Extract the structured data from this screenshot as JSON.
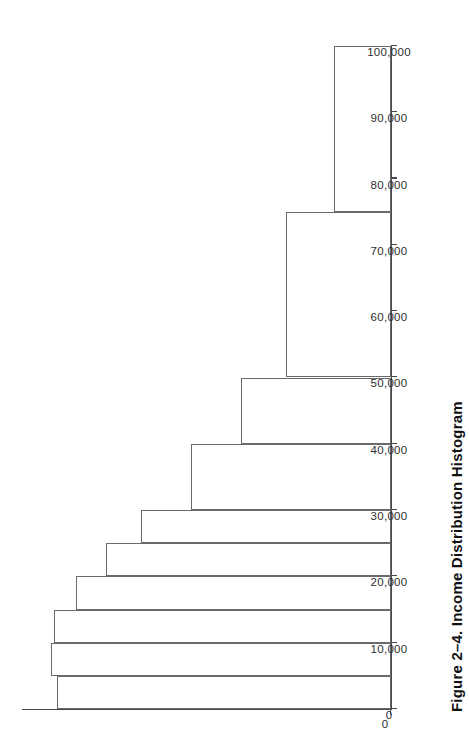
{
  "figure": {
    "caption": "Figure 2–4. Income Distribution Histogram",
    "caption_number": "Figure 2–4.",
    "caption_title": "Income Distribution Histogram"
  },
  "style": {
    "line_color": "#6a6a6a",
    "axis_color": "#4a4a4a",
    "background": "#ffffff",
    "text_color": "#2e2e2e",
    "bar_fill": "none"
  },
  "chart_data": {
    "type": "bar",
    "title": "Income Distribution Histogram",
    "xlabel": "",
    "ylabel": "",
    "grid": false,
    "legend": null,
    "orientation": "vertical-rotated-90ccw",
    "xlim": [
      0,
      100000
    ],
    "ylim": [
      0,
      400
    ],
    "x_tick_labels": [
      "0",
      "10,000",
      "20,000",
      "30,000",
      "40,000",
      "50,000",
      "60,000",
      "70,000",
      "80,000",
      "90,000",
      "100,000"
    ],
    "x_tick_values": [
      0,
      10000,
      20000,
      30000,
      40000,
      50000,
      60000,
      70000,
      80000,
      90000,
      100000
    ],
    "y_tick_labels": [
      "0"
    ],
    "y_tick_values": [
      0
    ],
    "bin_edges": [
      0,
      5000,
      10000,
      15000,
      20000,
      25000,
      30000,
      40000,
      50000,
      75000,
      100000
    ],
    "bins": [
      {
        "label": "0–5,000",
        "lower": 0,
        "upper": 5000,
        "value": 362
      },
      {
        "label": "5,000–10,000",
        "lower": 5000,
        "upper": 10000,
        "value": 369
      },
      {
        "label": "10,000–15,000",
        "lower": 10000,
        "upper": 15000,
        "value": 365
      },
      {
        "label": "15,000–20,000",
        "lower": 15000,
        "upper": 20000,
        "value": 341
      },
      {
        "label": "20,000–25,000",
        "lower": 20000,
        "upper": 25000,
        "value": 309
      },
      {
        "label": "25,000–30,000",
        "lower": 25000,
        "upper": 30000,
        "value": 271
      },
      {
        "label": "30,000–40,000",
        "lower": 30000,
        "upper": 40000,
        "value": 217
      },
      {
        "label": "40,000–50,000",
        "lower": 40000,
        "upper": 50000,
        "value": 163
      },
      {
        "label": "50,000–75,000",
        "lower": 50000,
        "upper": 75000,
        "value": 114
      },
      {
        "label": "75,000–100,000",
        "lower": 75000,
        "upper": 100000,
        "value": 62
      }
    ],
    "categories": [
      "0–5,000",
      "5,000–10,000",
      "10,000–15,000",
      "15,000–20,000",
      "20,000–25,000",
      "25,000–30,000",
      "30,000–40,000",
      "40,000–50,000",
      "50,000–75,000",
      "75,000–100,000"
    ],
    "values": [
      362,
      369,
      365,
      341,
      309,
      271,
      217,
      163,
      114,
      62
    ]
  }
}
